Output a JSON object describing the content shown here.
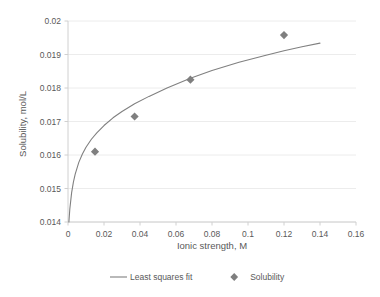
{
  "chart_data": {
    "type": "scatter",
    "title": "",
    "subtitle": "",
    "xlabel": "Ionic strength, M",
    "ylabel": "Solubility, mol/L",
    "xlim": [
      0,
      0.16
    ],
    "ylim": [
      0.014,
      0.02
    ],
    "xticks": [
      0,
      0.02,
      0.04,
      0.06,
      0.08,
      0.1,
      0.12,
      0.14,
      0.16
    ],
    "xtick_labels": [
      "0",
      "0.02",
      "0.04",
      "0.06",
      "0.08",
      "0.1",
      "0.12",
      "0.14",
      "0.16"
    ],
    "yticks": [
      0.014,
      0.015,
      0.016,
      0.017,
      0.018,
      0.019,
      0.02
    ],
    "ytick_labels": [
      "0.014",
      "0.015",
      "0.016",
      "0.017",
      "0.018",
      "0.019",
      "0.02"
    ],
    "grid": "horizontal",
    "legend_position": "bottom",
    "series": [
      {
        "name": "Least squares fit",
        "type": "line",
        "color": "#808080",
        "x": [
          0.0005,
          0.001,
          0.002,
          0.003,
          0.004,
          0.006,
          0.008,
          0.01,
          0.013,
          0.016,
          0.02,
          0.025,
          0.03,
          0.037,
          0.045,
          0.055,
          0.068,
          0.08,
          0.095,
          0.11,
          0.12,
          0.13,
          0.14
        ],
        "y": [
          0.014,
          0.01438,
          0.01487,
          0.01519,
          0.01543,
          0.01578,
          0.01603,
          0.01623,
          0.01647,
          0.01666,
          0.01688,
          0.01711,
          0.0173,
          0.01753,
          0.01775,
          0.018,
          0.01829,
          0.01852,
          0.01877,
          0.01898,
          0.01911,
          0.01923,
          0.01934
        ]
      },
      {
        "name": "Solubility",
        "type": "scatter",
        "color": "#7f7f7f",
        "marker": "diamond",
        "x": [
          0.015,
          0.037,
          0.068,
          0.12
        ],
        "y": [
          0.0161,
          0.01715,
          0.01825,
          0.01958
        ]
      }
    ],
    "legend": [
      {
        "label": "Least squares fit",
        "marker": "line",
        "color": "#808080"
      },
      {
        "label": "Solubility",
        "marker": "diamond",
        "color": "#7f7f7f"
      }
    ]
  },
  "colors": {
    "line": "#808080",
    "marker": "#7f7f7f",
    "grid": "#ececec",
    "axis": "#d0d0d0",
    "text": "#595959",
    "background": "#ffffff"
  }
}
